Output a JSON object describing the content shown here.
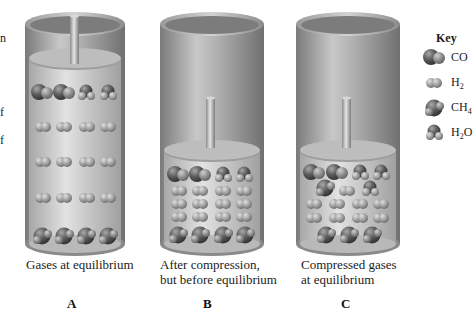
{
  "figure": {
    "panels": [
      {
        "id": "A",
        "letter": "A",
        "caption_lines": [
          "Gases at equilibrium"
        ],
        "state": "piston high, gases at equilibrium",
        "rows": [
          {
            "molecule": "CO",
            "count": 2,
            "then": {
              "molecule": "H2O",
              "count": 2
            }
          },
          {
            "molecule": "H2",
            "count": 4
          },
          {
            "molecule": "H2",
            "count": 4
          },
          {
            "molecule": "H2",
            "count": 4
          },
          {
            "molecule": "CH4",
            "count": 4
          }
        ]
      },
      {
        "id": "B",
        "letter": "B",
        "caption_lines": [
          "After compression,",
          "but before equilibrium"
        ],
        "state": "piston low, compressed before equilibrium",
        "rows": [
          {
            "molecule": "CO",
            "count": 2,
            "then": {
              "molecule": "H2O",
              "count": 2
            }
          },
          {
            "molecule": "H2",
            "count": 4
          },
          {
            "molecule": "H2",
            "count": 4
          },
          {
            "molecule": "H2",
            "count": 4
          },
          {
            "molecule": "CH4",
            "count": 4
          }
        ]
      },
      {
        "id": "C",
        "letter": "C",
        "caption_lines": [
          "Compressed gases",
          "at equilibrium"
        ],
        "state": "piston low, new equilibrium",
        "rows": [
          {
            "molecule": "CO",
            "count": 2,
            "then": {
              "molecule": "H2O",
              "count": 2
            }
          },
          {
            "mixed": [
              "CH4",
              "H2",
              "H2O"
            ]
          },
          {
            "molecule": "H2",
            "count": 4
          },
          {
            "molecule": "H2",
            "count": 4
          },
          {
            "molecule": "CH4",
            "count": 3
          }
        ]
      }
    ],
    "key": {
      "title": "Key",
      "items": [
        {
          "symbol": "CO",
          "base": "CO",
          "sub": "",
          "tail": ""
        },
        {
          "symbol": "H2",
          "base": "H",
          "sub": "2",
          "tail": ""
        },
        {
          "symbol": "CH4",
          "base": "CH",
          "sub": "4",
          "tail": ""
        },
        {
          "symbol": "H2O",
          "base": "H",
          "sub": "2",
          "tail": "O"
        }
      ]
    },
    "left_edge_fragments": [
      "n",
      "f",
      "f"
    ]
  },
  "colors": {
    "cylinder_dark": "#6e6e6e",
    "cylinder_mid": "#a9a9a9",
    "cylinder_light": "#d8d8d8",
    "gas_fill": "#c9c9c9",
    "molecule_dark": "#4a4a4a",
    "molecule_light": "#8c8c8c"
  }
}
